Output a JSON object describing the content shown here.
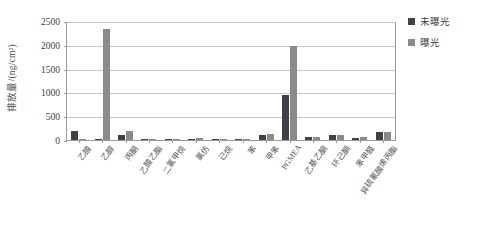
{
  "chart_data": {
    "type": "bar",
    "title": "",
    "xlabel": "",
    "ylabel": "排放量/(ng/cm²)",
    "ylim": [
      0,
      2500
    ],
    "ytick_step": 500,
    "yticks": [
      "0",
      "500",
      "1000",
      "1500",
      "2000",
      "2500"
    ],
    "grid": true,
    "legend_position": "right",
    "categories": [
      "乙酸",
      "乙醇",
      "丙酮",
      "乙酸乙酯",
      "二氯甲烷",
      "氯仿",
      "己烷",
      "苯",
      "甲苯",
      "PGMEA",
      "乙基乙酮",
      "环己酮",
      "苯甲醛",
      "异硫氰酸烯丙酯"
    ],
    "series": [
      {
        "name": "未曝光",
        "color": "#404048",
        "values": [
          185,
          20,
          110,
          10,
          8,
          5,
          30,
          12,
          95,
          950,
          60,
          100,
          50,
          160
        ]
      },
      {
        "name": "曝光",
        "color": "#8a8a8a",
        "values": [
          30,
          2340,
          185,
          12,
          10,
          45,
          12,
          10,
          125,
          1980,
          70,
          115,
          55,
          175
        ]
      }
    ]
  },
  "legend": {
    "items": [
      {
        "label": "未曝光",
        "color": "#404048"
      },
      {
        "label": "曝光",
        "color": "#8a8a8a"
      }
    ]
  },
  "axis": {
    "y_title": "排放量/(ng/cm²)"
  }
}
